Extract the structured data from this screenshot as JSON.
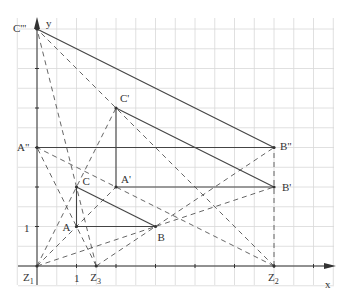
{
  "diagram": {
    "axes": {
      "x_label": "x",
      "y_label": "y",
      "x_tick_label": "1",
      "y_tick_label": "1"
    },
    "colors": {
      "grid": "#d8d8d8",
      "axis": "#333333",
      "solid": "#444444",
      "dashed": "#555555"
    },
    "points": {
      "A": {
        "label": "A",
        "x": 2,
        "y": 2
      },
      "B": {
        "label": "B",
        "x": 6,
        "y": 2
      },
      "C": {
        "label": "C",
        "x": 2,
        "y": 4
      },
      "A1": {
        "label": "A'",
        "x": 4,
        "y": 4
      },
      "B1": {
        "label": "B'",
        "x": 12,
        "y": 4
      },
      "C1": {
        "label": "C'",
        "x": 4,
        "y": 8
      },
      "A2": {
        "label": "A\"",
        "x": 0,
        "y": 6
      },
      "B2": {
        "label": "B\"",
        "x": 12,
        "y": 6
      },
      "C2": {
        "label": "C'''",
        "x": 0,
        "y": 12
      },
      "Z1": {
        "label": "Z",
        "sub": "1",
        "x": 0,
        "y": 0
      },
      "Z2": {
        "label": "Z",
        "sub": "2",
        "x": 12,
        "y": 0
      },
      "Z3": {
        "label": "Z",
        "sub": "3",
        "x": 3,
        "y": 0
      }
    },
    "solid_segments": [
      [
        "A",
        "B"
      ],
      [
        "B",
        "C"
      ],
      [
        "C",
        "A"
      ],
      [
        "A1",
        "B1"
      ],
      [
        "B1",
        "C1"
      ],
      [
        "C1",
        "A1"
      ],
      [
        "A2",
        "B2"
      ],
      [
        "B2",
        "C2"
      ]
    ],
    "dashed_segments": [
      [
        "Z1",
        "A1"
      ],
      [
        "Z1",
        "B1"
      ],
      [
        "Z1",
        "C1"
      ],
      [
        "Z2",
        "A2"
      ],
      [
        "Z2",
        "B2"
      ],
      [
        "Z2",
        "C2"
      ],
      [
        "Z3",
        "A2"
      ],
      [
        "Z3",
        "B2"
      ],
      [
        "Z3",
        "C2"
      ]
    ]
  }
}
